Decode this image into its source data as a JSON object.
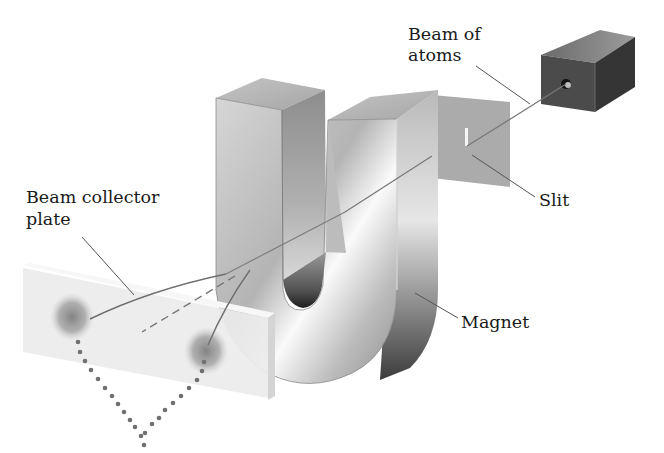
{
  "figure": {
    "background": "#ffffff"
  },
  "labels": {
    "beam_of_atoms": [
      "Beam of",
      "atoms"
    ],
    "slit": "Slit",
    "beam_collector_plate": [
      "Beam collector",
      "plate"
    ],
    "magnet": "Magnet"
  },
  "components": [
    {
      "name": "oven",
      "description": "dark box emitting beam of atoms"
    },
    {
      "name": "slit-plate",
      "description": "grey plate with narrow vertical slit"
    },
    {
      "name": "magnet",
      "description": "U-shaped magnet"
    },
    {
      "name": "collector-plate",
      "description": "plate with two deposited spots"
    }
  ],
  "colors": {
    "oven_front": "#4a4a4a",
    "oven_side": "#3a3a3a",
    "oven_top": "#8a8a8a",
    "slit_plate": "#a8a8a8",
    "magnet_light": "#f2f2f2",
    "magnet_dark": "#555555",
    "collector_plate": "#ececec",
    "spot": "#8a8a8a",
    "beam_line": "#6f6f6f",
    "dots": "#707070"
  }
}
